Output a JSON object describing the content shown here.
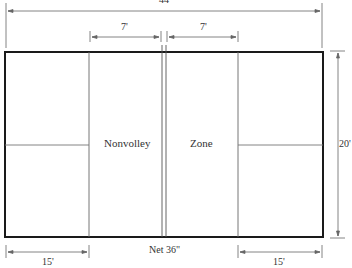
{
  "diagram": {
    "labels": {
      "overall_length": "44'",
      "kitchen_left": "7'",
      "kitchen_right": "7'",
      "width": "20'",
      "baseline_left": "15'",
      "baseline_right": "15'",
      "net": "Net 36\"",
      "zone_left": "Nonvolley",
      "zone_right": "Zone"
    },
    "colors": {
      "court_border": "#1a1a1a",
      "lines": "#555555",
      "dimension_lines": "#666666"
    }
  }
}
